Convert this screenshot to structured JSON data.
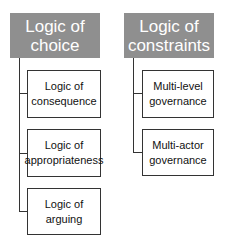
{
  "columns": [
    {
      "header": "Logic of choice",
      "children": [
        "Logic of consequence",
        "Logic of appropriateness",
        "Logic of arguing"
      ]
    },
    {
      "header": "Logic of constraints",
      "children": [
        "Multi-level governance",
        "Multi-actor governance"
      ]
    }
  ],
  "colors": {
    "header_bg": "#8f8f8f",
    "header_text": "#ffffff",
    "border": "#333333"
  }
}
